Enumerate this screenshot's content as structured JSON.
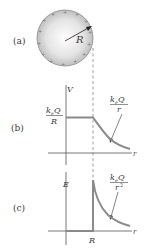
{
  "figure": {
    "panels": [
      {
        "id": "a",
        "label": "(a)",
        "sphere": {
          "radius_label": "R",
          "charge_sign": "+"
        }
      },
      {
        "id": "b",
        "label": "(b)",
        "y_axis_label": "V",
        "x_axis_label": "r",
        "inside_value": {
          "numerator": "k",
          "subscript": "e",
          "numerator_rest": "Q",
          "denominator": "R"
        },
        "outside_curve": {
          "numerator": "k",
          "subscript": "e",
          "numerator_rest": "Q",
          "denominator": "r"
        }
      },
      {
        "id": "c",
        "label": "(c)",
        "y_axis_label": "E",
        "x_axis_label": "r",
        "x_tick_label": "R",
        "outside_curve": {
          "numerator": "k",
          "subscript": "e",
          "numerator_rest": "Q",
          "denominator": "r",
          "exponent": "2"
        }
      }
    ],
    "colors": {
      "sphere_fill": "#c8c8c8",
      "curve": "#808080",
      "axis": "#555555",
      "text": "#3a3a3a"
    }
  }
}
